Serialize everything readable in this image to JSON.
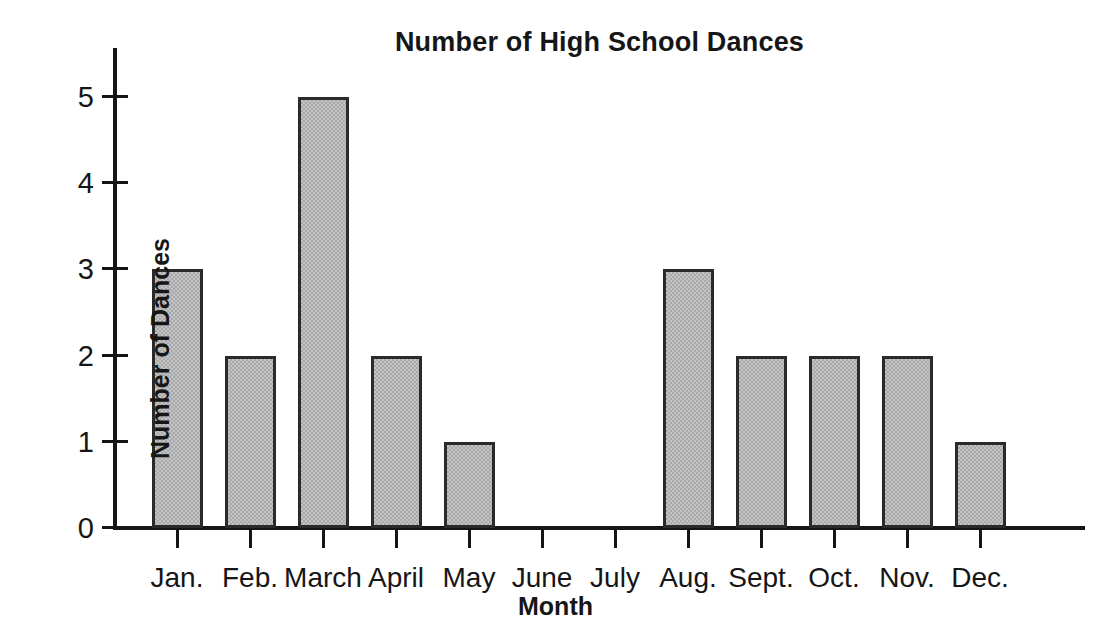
{
  "chart_data": {
    "type": "bar",
    "title": "Number of High School Dances",
    "xlabel": "Month",
    "ylabel": "Number of Dances",
    "categories": [
      "Jan.",
      "Feb.",
      "March",
      "April",
      "May",
      "June",
      "July",
      "Aug.",
      "Sept.",
      "Oct.",
      "Nov.",
      "Dec."
    ],
    "values": [
      3,
      2,
      5,
      2,
      1,
      0,
      0,
      3,
      2,
      2,
      2,
      1
    ],
    "ylim": [
      0,
      5
    ],
    "ytick_labels": [
      "0",
      "1",
      "2",
      "3",
      "4",
      "5"
    ],
    "ytick_values": [
      0,
      1,
      2,
      3,
      4,
      5
    ],
    "grid": false,
    "legend": false,
    "bar_fill_color": "#c3c3c3",
    "bar_edge_color": "#2a2a2a",
    "axis_color": "#151515",
    "background_color": "#ffffff"
  }
}
